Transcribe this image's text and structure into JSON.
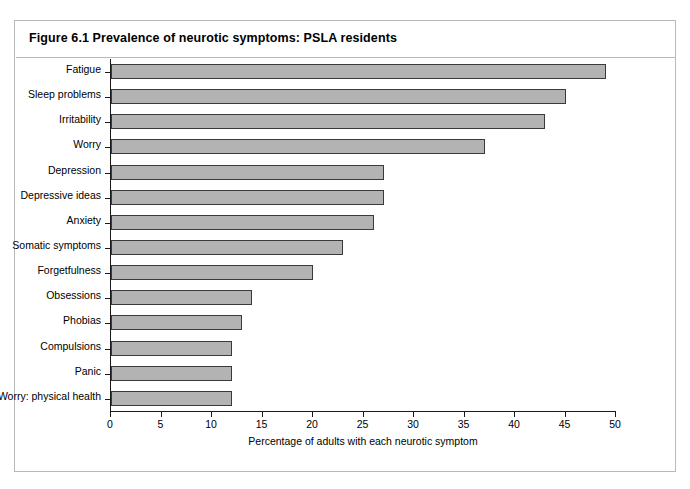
{
  "figure": {
    "title": "Figure 6.1  Prevalence of neurotic symptoms: PSLA residents"
  },
  "colors": {
    "bar_fill": "#b3b3b3",
    "bar_stroke": "#3a3a3a",
    "axis": "#1a1a1a",
    "frame_border": "#b9b9b9",
    "background": "#ffffff",
    "text": "#000000"
  },
  "chart_data": {
    "type": "bar",
    "orientation": "horizontal",
    "title": "Figure 6.1  Prevalence of neurotic symptoms: PSLA residents",
    "subtitle": "",
    "xlabel": "Percentage of adults with each neurotic symptom",
    "ylabel": "",
    "xlim": [
      0,
      50
    ],
    "ylim": null,
    "xticks": [
      0,
      5,
      10,
      15,
      20,
      25,
      30,
      35,
      40,
      45,
      50
    ],
    "xtick_labels": [
      "0",
      "5",
      "10",
      "15",
      "20",
      "25",
      "30",
      "35",
      "40",
      "45",
      "50"
    ],
    "grid": false,
    "legend": null,
    "legend_position": "none",
    "annotations": [],
    "categories": [
      "Fatigue",
      "Sleep problems",
      "Irritability",
      "Worry",
      "Depression",
      "Depressive ideas",
      "Anxiety",
      "Somatic symptoms",
      "Forgetfulness",
      "Obsessions",
      "Phobias",
      "Compulsions",
      "Panic",
      "Worry: physical health"
    ],
    "values": [
      49,
      45,
      43,
      37,
      27,
      27,
      26,
      23,
      20,
      14,
      13,
      12,
      12,
      12
    ],
    "series": [
      {
        "name": "Percentage of adults with each neurotic symptom",
        "values": [
          49,
          45,
          43,
          37,
          27,
          27,
          26,
          23,
          20,
          14,
          13,
          12,
          12,
          12
        ]
      }
    ]
  }
}
